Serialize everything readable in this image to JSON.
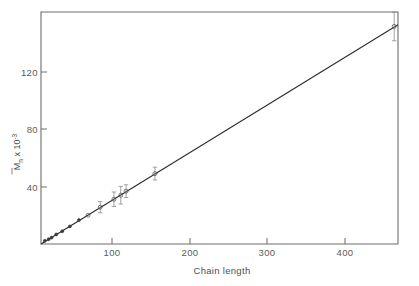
{
  "chart_data": {
    "type": "scatter",
    "title": "",
    "xlabel": "Chain length",
    "ylabel": "Mn x 10-3",
    "ylabel_parts": {
      "symbol": "M",
      "subscript": "n",
      "multiplier": " x 10",
      "exponent": "-3",
      "overbar": true
    },
    "xlim": [
      0,
      470
    ],
    "ylim": [
      0,
      145
    ],
    "xticks": [
      100,
      200,
      300,
      400
    ],
    "xtick_labels": [
      "100",
      "200",
      "300",
      "400"
    ],
    "yticks": [
      40,
      80,
      120
    ],
    "ytick_labels": [
      "40",
      "80",
      "120"
    ],
    "grid": false,
    "legend": false,
    "frame": "box",
    "series": [
      {
        "name": "Mn vs chain length",
        "marker": "circle",
        "line_fit": {
          "type": "linear",
          "intercept": 0,
          "slope": 0.292,
          "x_start": 0,
          "x_end": 470,
          "y_start": 0,
          "y_end": 137
        },
        "points": [
          {
            "x": 5,
            "y": 2,
            "yerr": 0
          },
          {
            "x": 10,
            "y": 3,
            "yerr": 0
          },
          {
            "x": 14,
            "y": 4,
            "yerr": 0
          },
          {
            "x": 20,
            "y": 6,
            "yerr": 0
          },
          {
            "x": 28,
            "y": 8,
            "yerr": 0
          },
          {
            "x": 38,
            "y": 11,
            "yerr": 0
          },
          {
            "x": 50,
            "y": 15,
            "yerr": 0
          },
          {
            "x": 62,
            "y": 18,
            "yerr": 0
          },
          {
            "x": 78,
            "y": 23,
            "yerr": 3.5
          },
          {
            "x": 96,
            "y": 28,
            "yerr": 4.5
          },
          {
            "x": 105,
            "y": 30.5,
            "yerr": 5.5
          },
          {
            "x": 112,
            "y": 33,
            "yerr": 4.0
          },
          {
            "x": 150,
            "y": 44,
            "yerr": 4.0
          },
          {
            "x": 465,
            "y": 136,
            "yerr": 9.0
          }
        ]
      }
    ]
  },
  "axis": {
    "x_title": "Chain length",
    "y_symbol": "M",
    "y_sub": "n",
    "y_mult": " x 10",
    "y_exp": "-3"
  },
  "colors": {
    "frame": "#6d6d6d",
    "line": "#2b2b2b",
    "marker": "#5a5a5a",
    "errorbar": "#8a8a8a",
    "text": "#4f4f4f",
    "background": "#ffffff"
  }
}
